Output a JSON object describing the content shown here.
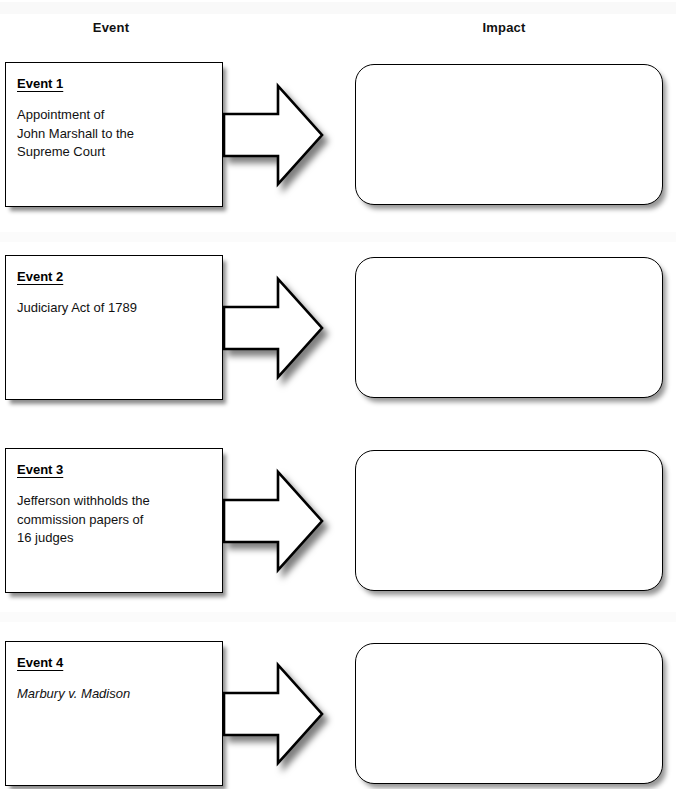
{
  "headers": {
    "event": "Event",
    "impact": "Impact"
  },
  "layout": {
    "rows_top": [
      62,
      255,
      448,
      641
    ],
    "row_pitch": 193,
    "ink_color": "#000000",
    "page_color": "#ffffff"
  },
  "arrow": {
    "name": "right-block-arrow",
    "fill": "#ffffff",
    "stroke": "#000000"
  },
  "rows": [
    {
      "event": {
        "title": "Event 1",
        "body": "Appointment of\nJohn Marshall to the\nSupreme Court",
        "italic": false
      },
      "impact": {
        "text": ""
      }
    },
    {
      "event": {
        "title": "Event 2",
        "body": "Judiciary Act of 1789",
        "italic": false
      },
      "impact": {
        "text": ""
      }
    },
    {
      "event": {
        "title": "Event 3",
        "body": "Jefferson withholds the\ncommission papers of\n16 judges",
        "italic": false
      },
      "impact": {
        "text": ""
      }
    },
    {
      "event": {
        "title": "Event 4",
        "body": "Marbury v. Madison",
        "italic": true
      },
      "impact": {
        "text": ""
      }
    }
  ]
}
